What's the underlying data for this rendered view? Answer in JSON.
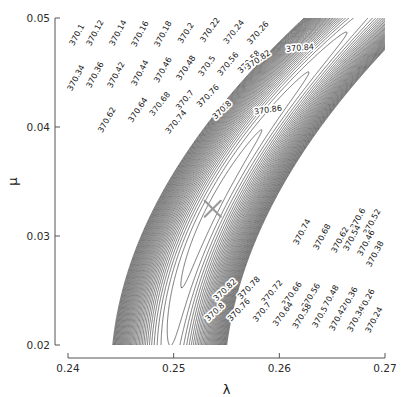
{
  "figure": {
    "type": "contour-plot",
    "background": "#ffffff",
    "contour_color": "#3c3c3c",
    "marker_color": "#9a9a9a",
    "axis_color": "#555555",
    "text_color": "#1a1a1a"
  },
  "axes": {
    "x": {
      "label": "λ",
      "label_name": "lambda",
      "min": 0.24,
      "max": 0.27,
      "ticks": [
        "0.24",
        "0.25",
        "0.26",
        "0.27"
      ],
      "tick_values": [
        0.24,
        0.25,
        0.26,
        0.27
      ]
    },
    "y": {
      "label": "μ",
      "label_name": "mu",
      "min": 0.02,
      "max": 0.05,
      "ticks": [
        "0.02",
        "0.03",
        "0.04",
        "0.05"
      ],
      "tick_values": [
        0.02,
        0.03,
        0.04,
        0.05
      ]
    }
  },
  "marker": {
    "symbol": "x",
    "name": "maximum-likelihood-estimate",
    "lambda": 0.2537,
    "mu": 0.0325
  },
  "chart_data": {
    "type": "contour",
    "title": "",
    "xlabel": "λ",
    "ylabel": "μ",
    "xlim": [
      0.24,
      0.27
    ],
    "ylim": [
      0.02,
      0.05
    ],
    "grid": false,
    "legend": "none",
    "level_step": 0.02,
    "level_min": 370.1,
    "level_max": 370.86,
    "levels": [
      370.1,
      370.12,
      370.14,
      370.16,
      370.18,
      370.2,
      370.22,
      370.24,
      370.26,
      370.28,
      370.3,
      370.32,
      370.34,
      370.36,
      370.38,
      370.4,
      370.42,
      370.44,
      370.46,
      370.48,
      370.5,
      370.52,
      370.54,
      370.56,
      370.58,
      370.6,
      370.62,
      370.64,
      370.66,
      370.68,
      370.7,
      370.72,
      370.74,
      370.76,
      370.78,
      370.8,
      370.82,
      370.84,
      370.86
    ],
    "peak": {
      "lambda": 0.2537,
      "mu": 0.0325,
      "value": 370.87
    },
    "labels_visible": [
      "370.1",
      "370.12",
      "370.14",
      "370.16",
      "370.18",
      "370.2",
      "370.22",
      "370.24",
      "370.26",
      "370.34",
      "370.36",
      "370.38",
      "370.42",
      "370.44",
      "370.46",
      "370.48",
      "370.5",
      "370.52",
      "370.54",
      "370.56",
      "370.58",
      "370.6",
      "370.62",
      "370.64",
      "370.66",
      "370.68",
      "370.7",
      "370.72",
      "370.74",
      "370.76",
      "370.78",
      "370.8",
      "370.82",
      "370.84",
      "370.86"
    ],
    "labels": [
      {
        "text": "370.1",
        "x": 77,
        "y": 35,
        "rot": -62
      },
      {
        "text": "370.12",
        "x": 95,
        "y": 33,
        "rot": -62
      },
      {
        "text": "370.14",
        "x": 118,
        "y": 33,
        "rot": -62
      },
      {
        "text": "370.16",
        "x": 140,
        "y": 34,
        "rot": -62
      },
      {
        "text": "370.18",
        "x": 163,
        "y": 34,
        "rot": -62
      },
      {
        "text": "370.2",
        "x": 186,
        "y": 33,
        "rot": -58
      },
      {
        "text": "370.22",
        "x": 210,
        "y": 30,
        "rot": -55
      },
      {
        "text": "370.24",
        "x": 234,
        "y": 32,
        "rot": -52
      },
      {
        "text": "370.26",
        "x": 258,
        "y": 33,
        "rot": -48
      },
      {
        "text": "370.34",
        "x": 76,
        "y": 78,
        "rot": -62
      },
      {
        "text": "370.36",
        "x": 95,
        "y": 75,
        "rot": -62
      },
      {
        "text": "370.42",
        "x": 116,
        "y": 75,
        "rot": -62
      },
      {
        "text": "370.44",
        "x": 140,
        "y": 73,
        "rot": -62
      },
      {
        "text": "370.46",
        "x": 163,
        "y": 70,
        "rot": -60
      },
      {
        "text": "370.48",
        "x": 186,
        "y": 68,
        "rot": -56
      },
      {
        "text": "370.5",
        "x": 207,
        "y": 66,
        "rot": -54
      },
      {
        "text": "370.56",
        "x": 228,
        "y": 64,
        "rot": -50
      },
      {
        "text": "370.58",
        "x": 249,
        "y": 62,
        "rot": -46
      },
      {
        "text": "370.62",
        "x": 107,
        "y": 120,
        "rot": -60
      },
      {
        "text": "370.64",
        "x": 138,
        "y": 110,
        "rot": -56
      },
      {
        "text": "370.68",
        "x": 160,
        "y": 104,
        "rot": -52
      },
      {
        "text": "370.7",
        "x": 185,
        "y": 100,
        "rot": -50
      },
      {
        "text": "370.74",
        "x": 176,
        "y": 122,
        "rot": -50
      },
      {
        "text": "370.76",
        "x": 208,
        "y": 96,
        "rot": -46
      },
      {
        "text": "370.8",
        "x": 222,
        "y": 110,
        "rot": -44
      },
      {
        "text": "370.82",
        "x": 258,
        "y": 60,
        "rot": -34
      },
      {
        "text": "370.84",
        "x": 300,
        "y": 48,
        "rot": -5
      },
      {
        "text": "370.86",
        "x": 268,
        "y": 110,
        "rot": -8
      },
      {
        "text": "370.74",
        "x": 302,
        "y": 232,
        "rot": -62
      },
      {
        "text": "370.68",
        "x": 322,
        "y": 237,
        "rot": -62
      },
      {
        "text": "370.62",
        "x": 340,
        "y": 240,
        "rot": -62
      },
      {
        "text": "370.6",
        "x": 358,
        "y": 219,
        "rot": -62
      },
      {
        "text": "370.54",
        "x": 352,
        "y": 238,
        "rot": -62
      },
      {
        "text": "370.52",
        "x": 372,
        "y": 222,
        "rot": -62
      },
      {
        "text": "370.46",
        "x": 366,
        "y": 243,
        "rot": -62
      },
      {
        "text": "370.38",
        "x": 375,
        "y": 254,
        "rot": -62
      },
      {
        "text": "370.82",
        "x": 225,
        "y": 290,
        "rot": -43
      },
      {
        "text": "370.8",
        "x": 215,
        "y": 312,
        "rot": -43
      },
      {
        "text": "370.78",
        "x": 249,
        "y": 288,
        "rot": -46
      },
      {
        "text": "370.76",
        "x": 239,
        "y": 310,
        "rot": -46
      },
      {
        "text": "370.72",
        "x": 272,
        "y": 292,
        "rot": -50
      },
      {
        "text": "370.7",
        "x": 262,
        "y": 312,
        "rot": -50
      },
      {
        "text": "370.66",
        "x": 292,
        "y": 294,
        "rot": -54
      },
      {
        "text": "370.64",
        "x": 283,
        "y": 314,
        "rot": -54
      },
      {
        "text": "370.56",
        "x": 311,
        "y": 296,
        "rot": -58
      },
      {
        "text": "370.58",
        "x": 302,
        "y": 316,
        "rot": -58
      },
      {
        "text": "370.48",
        "x": 330,
        "y": 298,
        "rot": -60
      },
      {
        "text": "370.5",
        "x": 320,
        "y": 317,
        "rot": -60
      },
      {
        "text": "370.36",
        "x": 349,
        "y": 300,
        "rot": -62
      },
      {
        "text": "370.42",
        "x": 338,
        "y": 318,
        "rot": -62
      },
      {
        "text": "370.26",
        "x": 366,
        "y": 302,
        "rot": -62
      },
      {
        "text": "370.34",
        "x": 356,
        "y": 319,
        "rot": -62
      },
      {
        "text": "370.24",
        "x": 374,
        "y": 320,
        "rot": -62
      }
    ]
  }
}
